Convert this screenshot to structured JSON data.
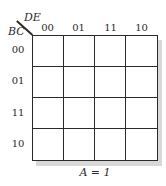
{
  "kmap": {
    "column_variable": "DE",
    "row_variable": "BC",
    "column_labels": [
      "00",
      "01",
      "11",
      "10"
    ],
    "row_labels": [
      "00",
      "01",
      "11",
      "10"
    ],
    "cells": [
      [
        "",
        "",
        "",
        ""
      ],
      [
        "",
        "",
        "",
        ""
      ],
      [
        "",
        "",
        "",
        ""
      ],
      [
        "",
        "",
        "",
        ""
      ]
    ],
    "caption": "A = 1"
  }
}
